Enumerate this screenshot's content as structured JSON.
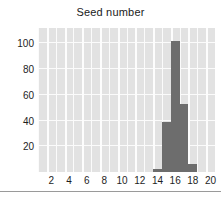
{
  "chart_data": {
    "type": "bar",
    "title": "Seed number",
    "xlabel": "",
    "ylabel": "",
    "categories": [
      1,
      2,
      3,
      4,
      5,
      6,
      7,
      8,
      9,
      10,
      11,
      12,
      13,
      14,
      15,
      16,
      17,
      18,
      19,
      20
    ],
    "values": [
      0,
      0,
      0,
      0,
      0,
      0,
      0,
      0,
      0,
      0,
      0,
      0,
      0,
      2,
      39,
      102,
      53,
      6,
      0,
      0
    ],
    "bars": [
      {
        "x": 14,
        "value": 2
      },
      {
        "x": 15,
        "value": 39
      },
      {
        "x": 16,
        "value": 102
      },
      {
        "x": 17,
        "value": 53
      },
      {
        "x": 18,
        "value": 6
      }
    ],
    "xlim": [
      0.5,
      20.5
    ],
    "ylim": [
      0,
      112
    ],
    "xticks": [
      2,
      4,
      6,
      8,
      10,
      12,
      14,
      16,
      18,
      20
    ],
    "yticks": [
      20,
      40,
      60,
      80,
      100
    ],
    "xtick_labels": [
      "2",
      "4",
      "6",
      "8",
      "10",
      "12",
      "14",
      "16",
      "18",
      "20"
    ],
    "ytick_labels": [
      "20",
      "40",
      "60",
      "80",
      "100"
    ],
    "grid": true,
    "legend": false,
    "bar_color": "#6d6d6d",
    "panel_color": "#e2e2e2",
    "grid_color": "#fbfbfb",
    "text_color": "#1e1e1e"
  }
}
